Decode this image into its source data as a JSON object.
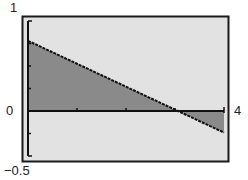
{
  "chart_data": {
    "type": "area",
    "title": "",
    "xlabel": "",
    "ylabel": "",
    "xlim": [
      0,
      4
    ],
    "ylim": [
      -0.5,
      1
    ],
    "grid": false,
    "legend": null,
    "tick_labels": {
      "y_top": "1",
      "y_zero": "0",
      "y_bottom": "−0.5",
      "x_right": "4"
    },
    "y_ticks_minor": [
      0.25,
      0.5,
      0.75,
      -0.25
    ],
    "x_ticks_minor": [
      1,
      2,
      3
    ],
    "series": [
      {
        "name": "line",
        "x": [
          0,
          1,
          2,
          3,
          3.06,
          4
        ],
        "y": [
          0.78,
          0.525,
          0.27,
          0.015,
          0.0,
          -0.24
        ]
      }
    ],
    "shading": "region between line and x-axis shaded (above axis for x<3.06, below axis for x>3.06)",
    "colors": {
      "background": "#e2e2e2",
      "shade": "#8a8a8a",
      "frame": "#1a1a1a",
      "line": "#111111"
    }
  }
}
